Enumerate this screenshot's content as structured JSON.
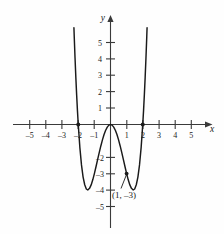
{
  "figure": {
    "axis_labels": {
      "x": "x",
      "y": "y"
    },
    "annotation": {
      "text": "(1, –3)",
      "x": 1,
      "y": -3
    }
  },
  "chart_data": {
    "type": "line",
    "title": "",
    "xlabel": "x",
    "ylabel": "y",
    "grid": false,
    "legend": null,
    "xlim": [
      -5.9,
      5.9
    ],
    "ylim": [
      -5.6,
      6.0
    ],
    "xticks": [
      -5,
      -4,
      -3,
      -2,
      -1,
      1,
      2,
      3,
      4,
      5
    ],
    "xtick_labels": [
      "–5",
      "–4",
      "–3",
      "–2",
      "–1",
      "1",
      "2",
      "3",
      "4",
      "5"
    ],
    "yticks": [
      5,
      4,
      3,
      2,
      1,
      -2,
      -3,
      -4,
      -5
    ],
    "ytick_labels": [
      "5",
      "4",
      "3",
      "2",
      "1",
      "–2",
      "–3",
      "–4",
      "–5"
    ],
    "function": "y = x^4 - 4x^2",
    "roots": [
      -2,
      0,
      2
    ],
    "minima": [
      {
        "x": -1.41,
        "y": -4
      },
      {
        "x": 1.41,
        "y": -4
      }
    ],
    "maxima": [
      {
        "x": 0,
        "y": 0
      }
    ],
    "marked_points": [
      {
        "x": -2,
        "y": 0,
        "label": ""
      },
      {
        "x": 2,
        "y": 0,
        "label": ""
      },
      {
        "x": 1,
        "y": -3,
        "label": "(1, –3)"
      }
    ],
    "series": [
      {
        "name": "y = x^4 - 4x^2",
        "x": [
          -2.32,
          -2.25,
          -2.2,
          -2.15,
          -2.1,
          -2.05,
          -2.0,
          -1.9,
          -1.8,
          -1.7,
          -1.6,
          -1.5,
          -1.41,
          -1.3,
          -1.2,
          -1.1,
          -1.0,
          -0.9,
          -0.8,
          -0.7,
          -0.6,
          -0.5,
          -0.4,
          -0.3,
          -0.2,
          -0.1,
          0.0,
          0.1,
          0.2,
          0.3,
          0.4,
          0.5,
          0.6,
          0.7,
          0.8,
          0.9,
          1.0,
          1.1,
          1.2,
          1.3,
          1.41,
          1.5,
          1.6,
          1.7,
          1.8,
          1.9,
          2.0,
          2.05,
          2.1,
          2.15,
          2.2,
          2.25,
          2.32
        ],
        "y": [
          7.47,
          5.37,
          4.06,
          2.88,
          1.81,
          0.85,
          0.0,
          -1.41,
          -2.47,
          -3.21,
          -3.68,
          -3.94,
          -4.0,
          -3.9,
          -3.69,
          -3.38,
          -3.0,
          -2.58,
          -2.15,
          -1.72,
          -1.31,
          -0.94,
          -0.61,
          -0.35,
          -0.16,
          -0.04,
          0.0,
          -0.04,
          -0.16,
          -0.35,
          -0.61,
          -0.94,
          -1.31,
          -1.72,
          -2.15,
          -2.58,
          -3.0,
          -3.38,
          -3.69,
          -3.9,
          -4.0,
          -3.94,
          -3.68,
          -3.21,
          -2.47,
          -1.41,
          0.0,
          0.85,
          1.81,
          2.88,
          4.06,
          5.37,
          7.47
        ]
      }
    ]
  }
}
